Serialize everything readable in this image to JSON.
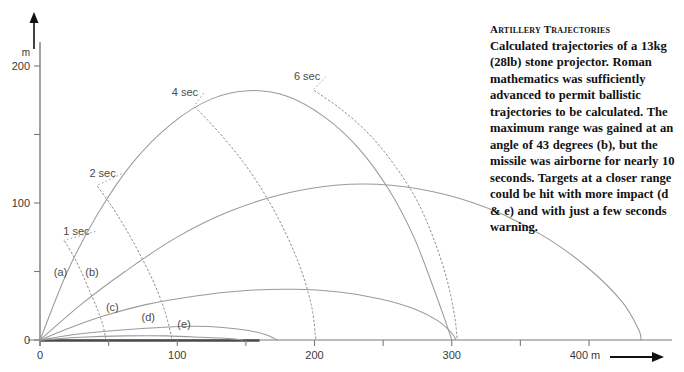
{
  "caption": {
    "title": "Artillery Trajectories",
    "body": "Calculated trajectories of a 13kg (28lb) stone projector. Roman mathematics was sufficiently advanced to permit ballistic trajectories to be calculated. The maximum range was gained at an angle of 43 degrees (b), but the missile was airborne for nearly 10 seconds. Targets at a closer range could be hit with more impact (d & e) and with just a few seconds warning."
  },
  "chart_data": {
    "type": "line",
    "title": "Artillery Trajectories",
    "xlabel": "m",
    "ylabel": "m",
    "xlim": [
      0,
      450
    ],
    "ylim": [
      0,
      215
    ],
    "grid": false,
    "legend": "inline-labels",
    "x_ticks": [
      0,
      50,
      100,
      150,
      200,
      250,
      300,
      350,
      400
    ],
    "x_tick_labels": [
      "0",
      "",
      "100",
      "",
      "200",
      "",
      "300",
      "",
      "400 m"
    ],
    "y_ticks": [
      0,
      50,
      100,
      150,
      200
    ],
    "y_tick_labels": [
      "0",
      "",
      "100",
      "",
      "200"
    ],
    "axis_arrow_x": true,
    "axis_arrow_y": true,
    "line_color": "#9a9a9a",
    "axis_color": "#7a7a7a",
    "series": [
      {
        "name": "(a)",
        "label": "(a)",
        "angle_deg": 70,
        "label_x": 10,
        "label_y": 47,
        "points": [
          [
            0,
            0
          ],
          [
            20,
            50
          ],
          [
            42,
            92
          ],
          [
            68,
            130
          ],
          [
            96,
            158
          ],
          [
            125,
            176
          ],
          [
            152,
            182
          ],
          [
            180,
            178
          ],
          [
            207,
            163
          ],
          [
            232,
            140
          ],
          [
            254,
            110
          ],
          [
            272,
            76
          ],
          [
            286,
            40
          ],
          [
            296,
            12
          ],
          [
            300,
            0
          ]
        ]
      },
      {
        "name": "(b)",
        "label": "(b)",
        "angle_deg": 43,
        "label_x": 33,
        "label_y": 47,
        "points": [
          [
            0,
            0
          ],
          [
            30,
            26
          ],
          [
            62,
            50
          ],
          [
            98,
            74
          ],
          [
            136,
            93
          ],
          [
            175,
            106
          ],
          [
            215,
            113
          ],
          [
            256,
            113
          ],
          [
            296,
            106
          ],
          [
            334,
            93
          ],
          [
            370,
            74
          ],
          [
            400,
            52
          ],
          [
            424,
            28
          ],
          [
            436,
            8
          ],
          [
            438,
            0
          ]
        ]
      },
      {
        "name": "(c)",
        "label": "(c)",
        "angle_deg": 24,
        "label_x": 48,
        "label_y": 21,
        "points": [
          [
            0,
            0
          ],
          [
            22,
            9
          ],
          [
            48,
            18
          ],
          [
            78,
            26
          ],
          [
            112,
            32
          ],
          [
            148,
            36
          ],
          [
            184,
            37
          ],
          [
            218,
            35
          ],
          [
            248,
            30
          ],
          [
            272,
            23
          ],
          [
            290,
            14
          ],
          [
            300,
            5
          ],
          [
            303,
            0
          ]
        ]
      },
      {
        "name": "(d)",
        "label": "(d)",
        "angle_deg": 11,
        "label_x": 74,
        "label_y": 14,
        "points": [
          [
            0,
            0
          ],
          [
            25,
            4
          ],
          [
            55,
            7
          ],
          [
            85,
            9
          ],
          [
            112,
            10
          ],
          [
            135,
            9
          ],
          [
            152,
            7
          ],
          [
            164,
            4
          ],
          [
            171,
            1
          ],
          [
            173,
            0
          ]
        ]
      },
      {
        "name": "(e)",
        "label": "(e)",
        "angle_deg": 4,
        "label_x": 100,
        "label_y": 9,
        "points": [
          [
            0,
            0
          ],
          [
            30,
            2
          ],
          [
            62,
            3
          ],
          [
            92,
            3
          ],
          [
            118,
            2
          ],
          [
            138,
            1
          ],
          [
            148,
            0
          ]
        ]
      }
    ],
    "isochrones": [
      {
        "label": "1 sec",
        "t": 1,
        "label_x": 17,
        "label_y": 77,
        "style": "dotted",
        "points": [
          [
            18,
            72
          ],
          [
            24,
            62
          ],
          [
            30,
            50
          ],
          [
            36,
            36
          ],
          [
            42,
            22
          ],
          [
            46,
            10
          ],
          [
            48,
            0
          ]
        ]
      },
      {
        "label": "2 sec",
        "t": 2,
        "label_x": 36,
        "label_y": 119,
        "style": "dotted",
        "points": [
          [
            42,
            112
          ],
          [
            52,
            98
          ],
          [
            62,
            82
          ],
          [
            72,
            64
          ],
          [
            82,
            44
          ],
          [
            90,
            24
          ],
          [
            95,
            6
          ],
          [
            96,
            0
          ]
        ]
      },
      {
        "label": "4 sec",
        "t": 4,
        "label_x": 96,
        "label_y": 178,
        "style": "dotted",
        "points": [
          [
            113,
            170
          ],
          [
            130,
            152
          ],
          [
            148,
            130
          ],
          [
            164,
            106
          ],
          [
            178,
            80
          ],
          [
            190,
            52
          ],
          [
            198,
            24
          ],
          [
            201,
            0
          ]
        ]
      },
      {
        "label": "6 sec",
        "t": 6,
        "label_x": 185,
        "label_y": 190,
        "style": "dotted",
        "points": [
          [
            200,
            182
          ],
          [
            220,
            168
          ],
          [
            240,
            150
          ],
          [
            258,
            128
          ],
          [
            274,
            103
          ],
          [
            286,
            76
          ],
          [
            296,
            46
          ],
          [
            302,
            18
          ],
          [
            304,
            0
          ]
        ]
      }
    ]
  }
}
